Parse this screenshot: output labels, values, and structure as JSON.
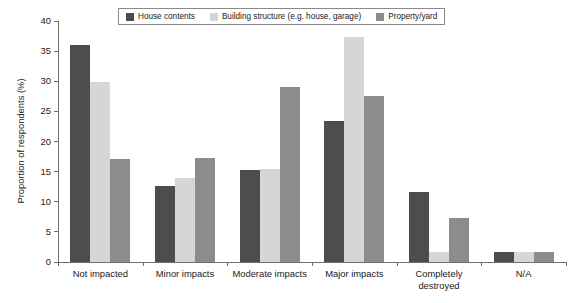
{
  "chart_data": {
    "type": "bar",
    "title": "",
    "subtitle": "",
    "xlabel": "",
    "ylabel": "Proportion of respondents (%)",
    "ylim": [
      0,
      40
    ],
    "yticks": [
      0,
      5,
      10,
      15,
      20,
      25,
      30,
      35,
      40
    ],
    "ytick_labels": [
      "0",
      "5",
      "10",
      "15",
      "20",
      "25",
      "30",
      "35",
      "40"
    ],
    "grid": false,
    "legend_position": "top-center",
    "categories": [
      "Not impacted",
      "Minor impacts",
      "Moderate impacts",
      "Major impacts",
      "Completely\ndestroyed",
      "N/A"
    ],
    "series": [
      {
        "name": "House contents",
        "color": "#4d4d4d",
        "values": [
          36.0,
          12.6,
          15.3,
          23.4,
          11.6,
          1.7
        ]
      },
      {
        "name": "Building structure (e.g. house, garage)",
        "color": "#d6d6d6",
        "values": [
          29.8,
          14.0,
          15.4,
          37.3,
          1.7,
          1.7
        ]
      },
      {
        "name": "Property/yard",
        "color": "#8c8c8c",
        "values": [
          17.1,
          17.2,
          29.0,
          27.5,
          7.3,
          1.7
        ]
      }
    ],
    "annotations": []
  },
  "axis": {
    "line_color": "#6f6f6f"
  }
}
